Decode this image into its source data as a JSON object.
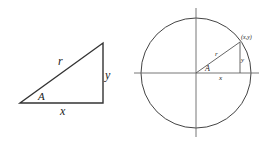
{
  "triangle": {
    "hypotenuse_label": "r",
    "vertical_label": "y",
    "horizontal_label": "x",
    "angle_label": "A"
  },
  "unit_circle": {
    "hypotenuse_label": "r",
    "vertical_label": "y",
    "horizontal_label": "x",
    "angle_label": "A",
    "point_label": "(x,y)"
  },
  "colors": {
    "stroke": "#333333",
    "background": "#ffffff"
  }
}
